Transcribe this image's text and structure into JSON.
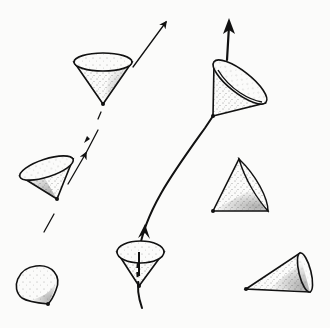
{
  "diagram": {
    "colors": {
      "ink": "#111111",
      "paper": "#fbfbfa"
    },
    "worldlines": [
      {
        "id": "straight-dashed",
        "style": "dashed",
        "from": [
          44,
          232
        ],
        "to": [
          166,
          22
        ],
        "arrowheads": 2
      },
      {
        "id": "curved-solid",
        "style": "solid",
        "from": [
          142,
          308
        ],
        "to": [
          229,
          20
        ],
        "arrowheads": 2
      }
    ],
    "cones": [
      {
        "id": "cone-upright-top",
        "apex": [
          103,
          104
        ]
      },
      {
        "id": "cone-tilted-left",
        "apex": [
          57,
          199
        ]
      },
      {
        "id": "cone-tilted-top-right",
        "apex": [
          213,
          116
        ]
      },
      {
        "id": "cone-triangle-right",
        "apex": [
          213,
          211
        ]
      },
      {
        "id": "cone-blob-bottom-left",
        "apex": [
          48,
          304
        ]
      },
      {
        "id": "cone-upright-bottom",
        "apex": [
          139,
          286
        ]
      },
      {
        "id": "cone-sideways-bottom-right",
        "apex": [
          246,
          289
        ]
      }
    ]
  }
}
